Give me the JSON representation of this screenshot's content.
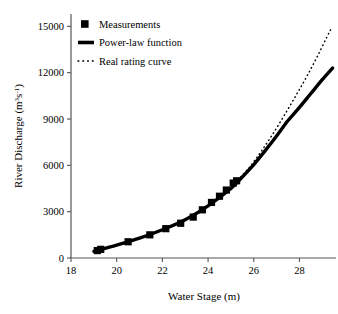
{
  "chart_data": {
    "type": "line",
    "title": "",
    "xlabel": "Water Stage (m)",
    "ylabel": "River Discharge (m³s⁻¹)",
    "ylabel_parts": {
      "text": "River Discharge (m",
      "sup1": "3",
      "mid": "s",
      "sup2": "-1",
      "tail": ")"
    },
    "xlim": [
      18,
      29.6
    ],
    "ylim": [
      0,
      15800
    ],
    "xticks": [
      18,
      20,
      22,
      24,
      26,
      28
    ],
    "xtick_labels": [
      "18",
      "20",
      "22",
      "24",
      "26",
      "28"
    ],
    "yticks": [
      0,
      3000,
      6000,
      9000,
      12000,
      15000
    ],
    "ytick_labels": [
      "0",
      "3000",
      "6000",
      "9000",
      "12000",
      "15000"
    ],
    "grid": false,
    "legend_position": "top-left",
    "series": [
      {
        "name": "Measurements",
        "style": "marker",
        "marker": "filled-square",
        "color": "#000000",
        "points": [
          {
            "x": 19.15,
            "y": 480
          },
          {
            "x": 19.3,
            "y": 560
          },
          {
            "x": 20.5,
            "y": 1050
          },
          {
            "x": 21.45,
            "y": 1500
          },
          {
            "x": 22.15,
            "y": 1900
          },
          {
            "x": 22.8,
            "y": 2250
          },
          {
            "x": 23.35,
            "y": 2650
          },
          {
            "x": 23.75,
            "y": 3120
          },
          {
            "x": 24.15,
            "y": 3600
          },
          {
            "x": 24.5,
            "y": 4000
          },
          {
            "x": 24.8,
            "y": 4400
          },
          {
            "x": 25.1,
            "y": 4850
          },
          {
            "x": 25.25,
            "y": 5000
          }
        ]
      },
      {
        "name": "Power-law function",
        "style": "solid-thick",
        "color": "#000000",
        "points": [
          {
            "x": 19.0,
            "y": 430
          },
          {
            "x": 20.0,
            "y": 830
          },
          {
            "x": 21.0,
            "y": 1280
          },
          {
            "x": 22.0,
            "y": 1830
          },
          {
            "x": 23.0,
            "y": 2480
          },
          {
            "x": 24.0,
            "y": 3380
          },
          {
            "x": 25.0,
            "y": 4500
          },
          {
            "x": 25.5,
            "y": 5250
          },
          {
            "x": 26.0,
            "y": 6050
          },
          {
            "x": 26.5,
            "y": 6950
          },
          {
            "x": 27.0,
            "y": 7900
          },
          {
            "x": 27.5,
            "y": 8900
          },
          {
            "x": 28.0,
            "y": 9750
          },
          {
            "x": 28.5,
            "y": 10650
          },
          {
            "x": 29.0,
            "y": 11550
          },
          {
            "x": 29.45,
            "y": 12300
          }
        ]
      },
      {
        "name": "Real rating curve",
        "style": "dotted",
        "color": "#000000",
        "points": [
          {
            "x": 25.3,
            "y": 5050
          },
          {
            "x": 25.8,
            "y": 5850
          },
          {
            "x": 26.3,
            "y": 6850
          },
          {
            "x": 26.8,
            "y": 7950
          },
          {
            "x": 27.3,
            "y": 9150
          },
          {
            "x": 27.8,
            "y": 10400
          },
          {
            "x": 28.3,
            "y": 11700
          },
          {
            "x": 28.8,
            "y": 13100
          },
          {
            "x": 29.3,
            "y": 14600
          },
          {
            "x": 29.45,
            "y": 14950
          }
        ]
      }
    ],
    "legend": [
      {
        "label": "Measurements",
        "style": "filled-square"
      },
      {
        "label": "Power-law function",
        "style": "solid-thick"
      },
      {
        "label": "Real rating curve",
        "style": "dotted"
      }
    ]
  }
}
